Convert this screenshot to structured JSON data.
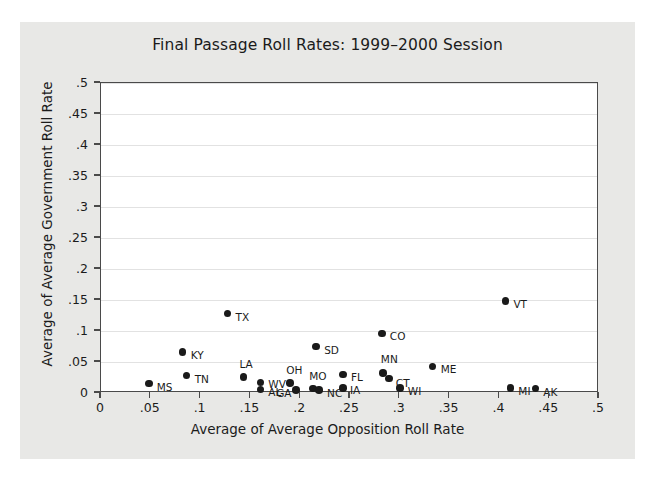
{
  "chart_data": {
    "type": "scatter",
    "title": "Final Passage Roll Rates: 1999–2000 Session",
    "xlabel": "Average of Average Opposition Roll Rate",
    "ylabel": "Average of Average Government Roll Rate",
    "xlim": [
      0,
      0.5
    ],
    "ylim": [
      0,
      0.5
    ],
    "xticks": [
      "0",
      ".05",
      ".1",
      ".15",
      ".2",
      ".25",
      ".3",
      ".35",
      ".4",
      ".45",
      ".5"
    ],
    "xtick_values": [
      0,
      0.05,
      0.1,
      0.15,
      0.2,
      0.25,
      0.3,
      0.35,
      0.4,
      0.45,
      0.5
    ],
    "yticks": [
      "0",
      ".05",
      ".1",
      ".15",
      ".2",
      ".25",
      ".3",
      ".35",
      ".4",
      ".45",
      ".5"
    ],
    "ytick_values": [
      0,
      0.05,
      0.1,
      0.15,
      0.2,
      0.25,
      0.3,
      0.35,
      0.4,
      0.45,
      0.5
    ],
    "grid": "horizontal",
    "legend": null,
    "marker_color": "#1a1a1a",
    "points": [
      {
        "label": "MS",
        "x": 0.048,
        "y": 0.015,
        "label_dx": 8,
        "label_dy": 3
      },
      {
        "label": "KY",
        "x": 0.082,
        "y": 0.066,
        "label_dx": 8,
        "label_dy": 3
      },
      {
        "label": "TN",
        "x": 0.086,
        "y": 0.028,
        "label_dx": 8,
        "label_dy": 3
      },
      {
        "label": "LA",
        "x": 0.143,
        "y": 0.026,
        "label_dx": -4,
        "label_dy": -13
      },
      {
        "label": "WV",
        "x": 0.16,
        "y": 0.017,
        "label_dx": 8,
        "label_dy": 2
      },
      {
        "label": "AL",
        "x": 0.16,
        "y": 0.006,
        "label_dx": 8,
        "label_dy": 3
      },
      {
        "label": "TX",
        "x": 0.127,
        "y": 0.128,
        "label_dx": 8,
        "label_dy": 3
      },
      {
        "label": "OH",
        "x": 0.19,
        "y": 0.016,
        "label_dx": -4,
        "label_dy": -13
      },
      {
        "label": "GA",
        "x": 0.196,
        "y": 0.005,
        "label_dx": -20,
        "label_dy": 3
      },
      {
        "label": "MO",
        "x": 0.213,
        "y": 0.007,
        "label_dx": -4,
        "label_dy": -13
      },
      {
        "label": "NC",
        "x": 0.219,
        "y": 0.005,
        "label_dx": 8,
        "label_dy": 3
      },
      {
        "label": "SD",
        "x": 0.216,
        "y": 0.075,
        "label_dx": 8,
        "label_dy": 3
      },
      {
        "label": "IA",
        "x": 0.243,
        "y": 0.008,
        "label_dx": 7,
        "label_dy": 2
      },
      {
        "label": "FL",
        "x": 0.243,
        "y": 0.03,
        "label_dx": 8,
        "label_dy": 3
      },
      {
        "label": "CO",
        "x": 0.282,
        "y": 0.096,
        "label_dx": 8,
        "label_dy": 3
      },
      {
        "label": "MN",
        "x": 0.283,
        "y": 0.032,
        "label_dx": -2,
        "label_dy": -14
      },
      {
        "label": "CT",
        "x": 0.289,
        "y": 0.023,
        "label_dx": 7,
        "label_dy": 4
      },
      {
        "label": "WI",
        "x": 0.3,
        "y": 0.008,
        "label_dx": 8,
        "label_dy": 3
      },
      {
        "label": "ME",
        "x": 0.333,
        "y": 0.043,
        "label_dx": 8,
        "label_dy": 3
      },
      {
        "label": "VT",
        "x": 0.406,
        "y": 0.148,
        "label_dx": 8,
        "label_dy": 3
      },
      {
        "label": "MI",
        "x": 0.411,
        "y": 0.008,
        "label_dx": 8,
        "label_dy": 3
      },
      {
        "label": "AK",
        "x": 0.436,
        "y": 0.007,
        "label_dx": 8,
        "label_dy": 3
      }
    ]
  }
}
